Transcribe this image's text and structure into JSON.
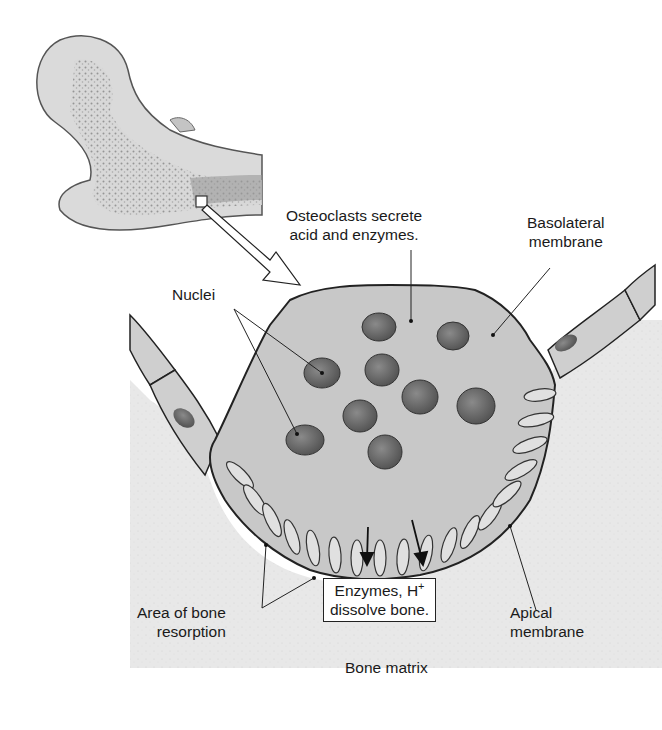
{
  "diagram": {
    "labels": {
      "osteoclasts_line1": "Osteoclasts secrete",
      "osteoclasts_line2": "acid and enzymes.",
      "basolateral_line1": "Basolateral",
      "basolateral_line2": "membrane",
      "nuclei": "Nuclei",
      "area_line1": "Area of bone",
      "area_line2": "resorption",
      "enzymes_line1": "Enzymes, H",
      "enzymes_sup": "+",
      "enzymes_line2": "dissolve bone.",
      "apical_line1": "Apical",
      "apical_line2": "membrane",
      "bone_matrix": "Bone matrix"
    },
    "colors": {
      "bone_matrix": "#e6e6e6",
      "cell": "#c9c9c9",
      "nucleus": "#5f5f5f",
      "outline": "#2a2a2a"
    }
  }
}
